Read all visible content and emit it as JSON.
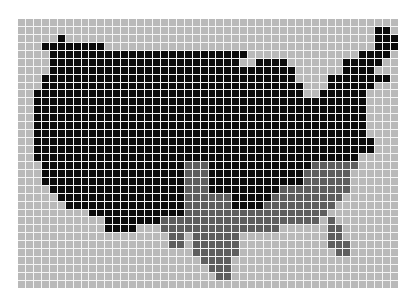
{
  "map": {
    "title": "",
    "description": "Pixel-grid map of the contiguous United States",
    "columns": 48,
    "rows": 34,
    "colors": {
      "background": "#b9b9b9",
      "region_a": "#0b0b0b",
      "region_b": "#5e5e5e",
      "gridline": "#f4f4f4"
    },
    "legend": [],
    "cells": [
      [],
      [
        [
          "b",
          45,
          46
        ]
      ],
      [
        [
          "b",
          5,
          5
        ],
        [
          "b",
          45,
          47
        ]
      ],
      [
        [
          "b",
          3,
          10
        ],
        [
          "b",
          45,
          47
        ]
      ],
      [
        [
          "b",
          4,
          28
        ],
        [
          "b",
          43,
          46
        ]
      ],
      [
        [
          "b",
          4,
          27
        ],
        [
          "b",
          30,
          33
        ],
        [
          "b",
          41,
          45
        ]
      ],
      [
        [
          "b",
          4,
          34
        ],
        [
          "b",
          41,
          44
        ]
      ],
      [
        [
          "b",
          3,
          34
        ],
        [
          "b",
          39,
          46
        ]
      ],
      [
        [
          "b",
          3,
          35
        ],
        [
          "b",
          39,
          44
        ]
      ],
      [
        [
          "b",
          2,
          35
        ],
        [
          "b",
          38,
          43
        ]
      ],
      [
        [
          "b",
          2,
          43
        ]
      ],
      [
        [
          "b",
          2,
          43
        ]
      ],
      [
        [
          "b",
          2,
          43
        ]
      ],
      [
        [
          "b",
          2,
          43
        ]
      ],
      [
        [
          "b",
          2,
          43
        ]
      ],
      [
        [
          "b",
          2,
          44
        ]
      ],
      [
        [
          "b",
          2,
          44
        ]
      ],
      [
        [
          "b",
          2,
          42
        ]
      ],
      [
        [
          "b",
          3,
          20
        ],
        [
          "g",
          21,
          23
        ],
        [
          "b",
          24,
          36
        ],
        [
          "g",
          37,
          42
        ]
      ],
      [
        [
          "b",
          3,
          20
        ],
        [
          "g",
          21,
          23
        ],
        [
          "b",
          24,
          35
        ],
        [
          "g",
          36,
          41
        ]
      ],
      [
        [
          "b",
          3,
          20
        ],
        [
          "g",
          21,
          23
        ],
        [
          "b",
          24,
          35
        ],
        [
          "g",
          36,
          41
        ]
      ],
      [
        [
          "b",
          4,
          20
        ],
        [
          "g",
          21,
          23
        ],
        [
          "b",
          24,
          32
        ],
        [
          "g",
          33,
          41
        ]
      ],
      [
        [
          "b",
          5,
          20
        ],
        [
          "g",
          21,
          26
        ],
        [
          "b",
          27,
          31
        ],
        [
          "g",
          32,
          40
        ]
      ],
      [
        [
          "b",
          6,
          20
        ],
        [
          "g",
          21,
          26
        ],
        [
          "b",
          27,
          30
        ],
        [
          "g",
          31,
          39
        ]
      ],
      [
        [
          "b",
          9,
          20
        ],
        [
          "g",
          21,
          38
        ]
      ],
      [
        [
          "b",
          11,
          17
        ],
        [
          "g",
          18,
          37
        ],
        [
          "g",
          39,
          39
        ]
      ],
      [
        [
          "b",
          11,
          14
        ],
        [
          "g",
          18,
          32
        ],
        [
          "g",
          39,
          40
        ]
      ],
      [
        [
          "g",
          19,
          20
        ],
        [
          "g",
          22,
          27
        ],
        [
          "g",
          39,
          40
        ]
      ],
      [
        [
          "g",
          19,
          20
        ],
        [
          "g",
          22,
          27
        ],
        [
          "g",
          39,
          41
        ]
      ],
      [
        [
          "g",
          22,
          27
        ],
        [
          "g",
          40,
          41
        ]
      ],
      [
        [
          "g",
          23,
          26
        ]
      ],
      [
        [
          "g",
          24,
          26
        ]
      ],
      [
        [
          "g",
          25,
          26
        ]
      ],
      []
    ]
  }
}
